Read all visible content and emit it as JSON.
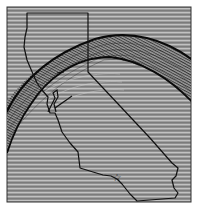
{
  "figure": {
    "type": "interferogram-map",
    "region": "California",
    "frame": {
      "x": 7,
      "y": 7,
      "width": 184,
      "height": 195
    },
    "colors": {
      "background": "#ffffff",
      "map_fill": "#8c8c8c",
      "fringe_light": "#bdbdbd",
      "fringe_dark": "#5e5e5e",
      "outline": "#111111",
      "arc": "#0a0a0a"
    },
    "markers": [
      {
        "name": "star-marker",
        "symbol": "☆",
        "x": 117,
        "y": 177
      }
    ],
    "features": [
      "state-outline",
      "outer-arc",
      "inner-arc",
      "dense-fringe-band",
      "bay-area-detail"
    ]
  }
}
